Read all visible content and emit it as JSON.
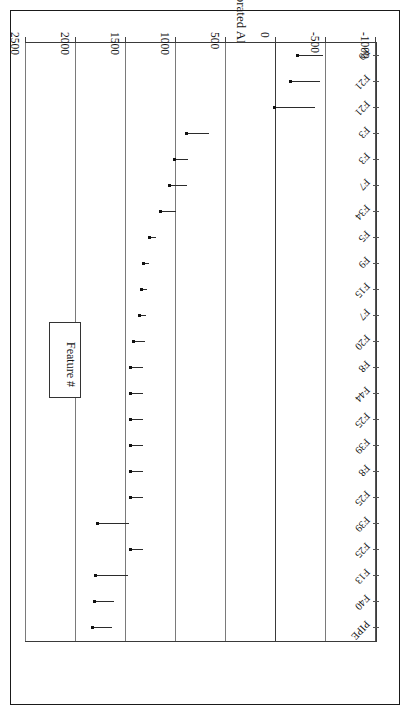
{
  "chart_data": {
    "type": "bar",
    "orientation": "horizontal-ranges",
    "title": "",
    "xlabel": "Feature #",
    "ylabel": "Calibrated AD/BC Ranges",
    "ylim": [
      -1000,
      2500
    ],
    "yticks": [
      2500,
      2000,
      1500,
      1000,
      500,
      0,
      -500,
      -1000
    ],
    "ytick_labels": [
      "2500",
      "2000",
      "1500",
      "1000",
      "500",
      "0",
      "-500",
      "-1000"
    ],
    "grid": true,
    "legend_title": "Feature #",
    "categories": [
      "F9",
      "F21",
      "F21",
      "F3",
      "F3",
      "F7",
      "F34",
      "F5",
      "F9",
      "F15",
      "F7",
      "F20",
      "F8",
      "F44",
      "F25",
      "F39",
      "F8",
      "F25",
      "F39",
      "F25",
      "F13",
      "F40",
      "PIPE"
    ],
    "series_note": "Each feature has a calibrated date marker (point estimate) and a horizontal range bar extending to the upper end of the calibrated range.",
    "points": [
      {
        "label": "F9",
        "value": -220,
        "range_low": -220,
        "range_high": -470
      },
      {
        "label": "F21",
        "value": -150,
        "range_low": -150,
        "range_high": -440
      },
      {
        "label": "F21",
        "value": 10,
        "range_low": 10,
        "range_high": -390
      },
      {
        "label": "F3",
        "value": 890,
        "range_low": 890,
        "range_high": 670
      },
      {
        "label": "F3",
        "value": 1010,
        "range_low": 1010,
        "range_high": 880
      },
      {
        "label": "F7",
        "value": 1060,
        "range_low": 1060,
        "range_high": 890
      },
      {
        "label": "F34",
        "value": 1150,
        "range_low": 1150,
        "range_high": 1000
      },
      {
        "label": "F5",
        "value": 1260,
        "range_low": 1260,
        "range_high": 1200
      },
      {
        "label": "F9",
        "value": 1320,
        "range_low": 1320,
        "range_high": 1270
      },
      {
        "label": "F15",
        "value": 1340,
        "range_low": 1340,
        "range_high": 1290
      },
      {
        "label": "F7",
        "value": 1360,
        "range_low": 1360,
        "range_high": 1300
      },
      {
        "label": "F20",
        "value": 1420,
        "range_low": 1420,
        "range_high": 1310
      },
      {
        "label": "F8",
        "value": 1450,
        "range_low": 1450,
        "range_high": 1330
      },
      {
        "label": "F44",
        "value": 1450,
        "range_low": 1450,
        "range_high": 1330
      },
      {
        "label": "F25",
        "value": 1450,
        "range_low": 1450,
        "range_high": 1330
      },
      {
        "label": "F39",
        "value": 1450,
        "range_low": 1450,
        "range_high": 1330
      },
      {
        "label": "F8",
        "value": 1450,
        "range_low": 1450,
        "range_high": 1330
      },
      {
        "label": "F25",
        "value": 1450,
        "range_low": 1450,
        "range_high": 1330
      },
      {
        "label": "F39",
        "value": 1780,
        "range_low": 1780,
        "range_high": 1470
      },
      {
        "label": "F25",
        "value": 1450,
        "range_low": 1450,
        "range_high": 1330
      },
      {
        "label": "F13",
        "value": 1800,
        "range_low": 1800,
        "range_high": 1480
      },
      {
        "label": "F40",
        "value": 1810,
        "range_low": 1810,
        "range_high": 1620
      },
      {
        "label": "PIPE",
        "value": 1830,
        "range_low": 1830,
        "range_high": 1640
      }
    ]
  },
  "colors": {
    "marker": "#111111",
    "grid": "#7a7a7a",
    "axis": "#3a3a3a",
    "frame": "#1a1a1a",
    "background": "#ffffff"
  }
}
